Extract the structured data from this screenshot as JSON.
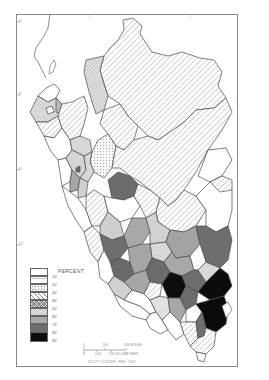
{
  "map": {
    "subject": "Peru departments/provinces choropleth",
    "legend": {
      "title": "PERCENT",
      "classes": [
        {
          "label": "10",
          "fill": "#ffffff",
          "pattern": "none"
        },
        {
          "label": "20",
          "fill": "#ffffff",
          "pattern": "hline"
        },
        {
          "label": "30",
          "fill": "#f4f4f4",
          "pattern": "dots"
        },
        {
          "label": "40",
          "fill": "#ffffff",
          "pattern": "diag-wide"
        },
        {
          "label": "50",
          "fill": "#ececec",
          "pattern": "diag-dense"
        },
        {
          "label": "60",
          "fill": "#d6d6d6",
          "pattern": "none"
        },
        {
          "label": "70",
          "fill": "#a9a9a9",
          "pattern": "none"
        },
        {
          "label": "80",
          "fill": "#6e6e6e",
          "pattern": "none"
        },
        {
          "label": "90",
          "fill": "#0c0c0c",
          "pattern": "none"
        }
      ]
    },
    "latitude_ticks": [
      {
        "label": "0°",
        "y": 22
      },
      {
        "label": "4°",
        "y": 95
      },
      {
        "label": "8°",
        "y": 170
      },
      {
        "label": "12°",
        "y": 245
      }
    ],
    "scale_bar": {
      "miles": [
        "0",
        "100",
        "200 MILES"
      ],
      "kilometers": [
        "0",
        "100",
        "200 KILOMETERS"
      ]
    },
    "credit": "SCOTT FOSTER, FEB. 1967",
    "colors": {
      "outline": "#4a4a4a",
      "frame": "#8a8a8a",
      "hatch": "#9a9a9a"
    }
  }
}
